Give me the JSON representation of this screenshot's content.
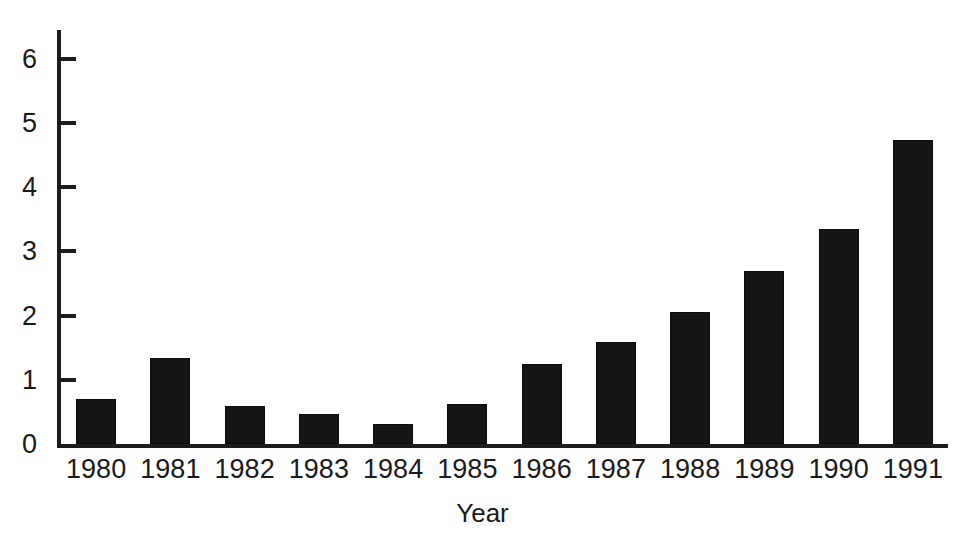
{
  "chart_data": {
    "type": "bar",
    "title": "",
    "title_remnant": "",
    "xlabel": "Year",
    "ylabel": "",
    "categories": [
      "1980",
      "1981",
      "1982",
      "1983",
      "1984",
      "1985",
      "1986",
      "1987",
      "1988",
      "1989",
      "1990",
      "1991"
    ],
    "values": [
      0.7,
      1.34,
      0.6,
      0.47,
      0.31,
      0.62,
      1.25,
      1.59,
      2.06,
      2.7,
      3.35,
      4.74
    ],
    "ylim": [
      0,
      6.45
    ],
    "yticks": [
      0,
      1,
      2,
      3,
      4,
      5,
      6
    ],
    "ytick_labels": [
      "0",
      "1",
      "2",
      "3",
      "4",
      "5",
      "6"
    ],
    "grid": false,
    "legend": null,
    "bar_color": "#151515",
    "axis_color": "#1c1c1c"
  }
}
